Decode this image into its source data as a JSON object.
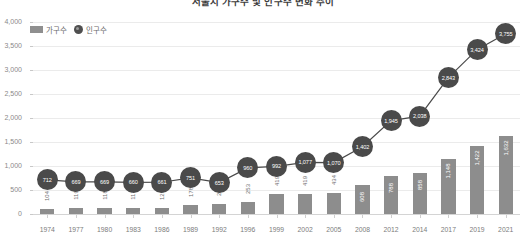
{
  "chart_data": {
    "type": "bar",
    "title": "서울시 가구수 및 인구수 변화 추이",
    "xlabel": "",
    "ylabel": "",
    "ylim": [
      0,
      4000
    ],
    "ytick_labels": [
      "0",
      "500",
      "1,000",
      "1,500",
      "2,000",
      "2,500",
      "3,000",
      "3,500",
      "4,000"
    ],
    "ytick_values": [
      0,
      500,
      1000,
      1500,
      2000,
      2500,
      3000,
      3500,
      4000
    ],
    "grid": true,
    "legend_position": "top-left",
    "categories": [
      "1974",
      "1977",
      "1980",
      "1983",
      "1986",
      "1989",
      "1992",
      "1996",
      "1999",
      "2002",
      "2005",
      "2008",
      "2012",
      "2014",
      "2017",
      "2019",
      "2021"
    ],
    "series": [
      {
        "name": "가구수",
        "type": "bar",
        "color": "#8d8d8d",
        "values": [
          104,
          119,
          118,
          117,
          126,
          178,
          204,
          253,
          419,
          419,
          434,
          608,
          788,
          858,
          1148,
          1422,
          1632
        ],
        "labels": [
          "104",
          "119",
          "118",
          "117",
          "126",
          "178",
          "204",
          "253",
          "419",
          "419",
          "434",
          "608",
          "788",
          "858",
          "1,148",
          "1,422",
          "1,632"
        ]
      },
      {
        "name": "인구수",
        "type": "line",
        "color": "#4a4a4a",
        "values": [
          712,
          669,
          669,
          660,
          661,
          751,
          653,
          960,
          992,
          1077,
          1070,
          1402,
          1945,
          2038,
          2843,
          3424,
          3755
        ],
        "labels": [
          "712",
          "669",
          "669",
          "660",
          "661",
          "751",
          "653",
          "960",
          "992",
          "1,077",
          "1,070",
          "1,402",
          "1,945",
          "2,038",
          "2,843",
          "3,424",
          "3,755"
        ]
      }
    ]
  },
  "legend": {
    "bar_label": "가구수",
    "line_label": "인구수"
  }
}
